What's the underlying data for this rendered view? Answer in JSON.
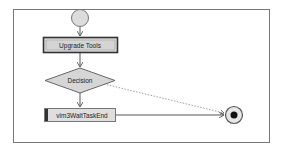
{
  "diagram": {
    "nodes": {
      "start": {
        "type": "initial-node"
      },
      "upgrade_tools": {
        "type": "action",
        "label": "Upgrade Tools"
      },
      "decision": {
        "type": "decision",
        "label": "Decision"
      },
      "wait_task": {
        "type": "action",
        "label": "vim3WaitTaskEnd"
      },
      "end": {
        "type": "final-node"
      }
    },
    "edges": [
      {
        "from": "start",
        "to": "upgrade_tools",
        "style": "solid"
      },
      {
        "from": "upgrade_tools",
        "to": "decision",
        "style": "solid"
      },
      {
        "from": "decision",
        "to": "wait_task",
        "style": "solid"
      },
      {
        "from": "decision",
        "to": "end",
        "style": "dashed"
      },
      {
        "from": "wait_task",
        "to": "end",
        "style": "solid"
      }
    ],
    "colors": {
      "node_fill": "#d9d9d9",
      "stroke": "#555555",
      "frame": "#777777"
    }
  }
}
